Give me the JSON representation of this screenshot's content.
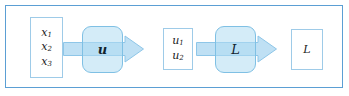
{
  "diagram": {
    "frame": {
      "border_color": "#5b9fd4",
      "background": "#ffffff"
    },
    "palette": {
      "frame_border": "#5b9fd4",
      "box_border": "#9ecbe8",
      "op_border": "#7fc0e4",
      "op_fill": "#b0dcf2",
      "arrow_fill": "#bfe0f4",
      "arrow_stroke": "#8ec6e8",
      "text": "#1b1b1b"
    },
    "nodes": [
      {
        "id": "box-x",
        "kind": "data-box",
        "shape": "rectangle",
        "lines": [
          {
            "base": "x",
            "sub": "1"
          },
          {
            "base": "x",
            "sub": "2"
          },
          {
            "base": "x",
            "sub": "3"
          }
        ]
      },
      {
        "id": "op-u",
        "kind": "operator-box",
        "shape": "rounded-rectangle",
        "label": "u",
        "style": "bold-italic"
      },
      {
        "id": "box-u",
        "kind": "data-box",
        "shape": "rectangle",
        "lines": [
          {
            "base": "u",
            "sub": "1"
          },
          {
            "base": "u",
            "sub": "2"
          }
        ]
      },
      {
        "id": "op-L",
        "kind": "operator-box",
        "shape": "rounded-rectangle",
        "label": "L",
        "style": "italic"
      },
      {
        "id": "box-L-out",
        "kind": "data-box",
        "shape": "rectangle",
        "lines": [
          {
            "base": "L",
            "sub": ""
          }
        ]
      }
    ],
    "arrows": [
      {
        "id": "arrow-1",
        "from": "box-x",
        "to": "box-u",
        "through": "op-u",
        "direction": "right"
      },
      {
        "id": "arrow-2",
        "from": "box-u",
        "to": "box-L-out",
        "through": "op-L",
        "direction": "right"
      }
    ]
  },
  "labels": {
    "x1_base": "x",
    "x1_sub": "1",
    "x2_base": "x",
    "x2_sub": "2",
    "x3_base": "x",
    "x3_sub": "3",
    "u1_base": "u",
    "u1_sub": "1",
    "u2_base": "u",
    "u2_sub": "2",
    "op_u": "u",
    "op_L": "L",
    "out_L": "L"
  }
}
